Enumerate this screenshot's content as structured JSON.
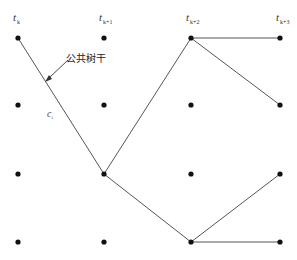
{
  "diagram": {
    "type": "trellis-survivor-paths",
    "time_labels": [
      {
        "base": "t",
        "sub": "k"
      },
      {
        "base": "t",
        "sub": "k+1"
      },
      {
        "base": "t",
        "sub": "k+2"
      },
      {
        "base": "t",
        "sub": "k+3"
      }
    ],
    "annotation": "公共树干",
    "path_label": {
      "base": "c",
      "sub": "i"
    },
    "columns_x": [
      18,
      104,
      191,
      280
    ],
    "rows_y": [
      38,
      105,
      174,
      242
    ],
    "edges": [
      {
        "from": [
          0,
          0
        ],
        "to": [
          1,
          2
        ]
      },
      {
        "from": [
          1,
          2
        ],
        "to": [
          2,
          0
        ]
      },
      {
        "from": [
          1,
          2
        ],
        "to": [
          2,
          3
        ]
      },
      {
        "from": [
          2,
          0
        ],
        "to": [
          3,
          0
        ]
      },
      {
        "from": [
          2,
          0
        ],
        "to": [
          3,
          1
        ]
      },
      {
        "from": [
          2,
          3
        ],
        "to": [
          3,
          2
        ]
      },
      {
        "from": [
          2,
          3
        ],
        "to": [
          3,
          3
        ]
      }
    ],
    "colors": {
      "node": "#111111",
      "edge": "#555555",
      "text": "#333333"
    }
  }
}
